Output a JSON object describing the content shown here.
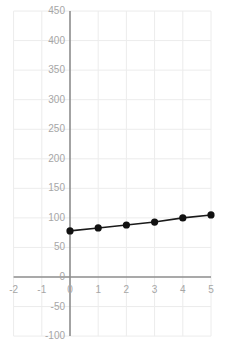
{
  "chart_data": {
    "type": "line",
    "title": "",
    "xlabel": "",
    "ylabel": "",
    "x": [
      0,
      1,
      2,
      3,
      4,
      5
    ],
    "values": [
      78,
      83,
      88,
      93,
      100,
      105
    ],
    "series": [
      {
        "name": "",
        "x": [
          0,
          1,
          2,
          3,
          4,
          5
        ],
        "values": [
          78,
          83,
          88,
          93,
          100,
          105
        ]
      }
    ],
    "xlim": [
      -2,
      5
    ],
    "ylim": [
      -100,
      450
    ],
    "x_ticks": [
      -2,
      -1,
      0,
      1,
      2,
      3,
      4,
      5
    ],
    "y_ticks": [
      -100,
      -50,
      0,
      50,
      100,
      150,
      200,
      250,
      300,
      350,
      400,
      450
    ],
    "x_tick_labels": [
      "-2",
      "-1",
      "0",
      "1",
      "2",
      "3",
      "4",
      "5"
    ],
    "y_tick_labels": [
      "-100",
      "-50",
      "0",
      "50",
      "100",
      "150",
      "200",
      "250",
      "300",
      "350",
      "400",
      "450"
    ],
    "grid": true,
    "legend": false,
    "legend_position": "none",
    "marker": "circle",
    "colors": {
      "series_line": "#1a1a1a",
      "series_marker": "#111111",
      "axis": "#8c8c8c",
      "grid": "#ececec",
      "tick_label": "#a6a6a6",
      "background": "#ffffff"
    }
  }
}
